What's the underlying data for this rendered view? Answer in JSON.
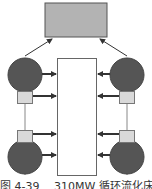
{
  "diagram": {
    "title_caption": "图 4-39 　310MW 循环流化床锅炉",
    "colors": {
      "top_box_fill": "#b3b3b3",
      "top_box_stroke": "#555555",
      "center_box_fill": "#ffffff",
      "center_box_stroke": "#666666",
      "circle_fill": "#555555",
      "circle_stroke": "#444444",
      "small_box_fill": "#d9d9d9",
      "small_box_stroke": "#777777",
      "arrow_color": "#333333",
      "line_color": "#888888"
    },
    "nodes": [
      {
        "id": "top-box",
        "shape": "rect"
      },
      {
        "id": "center-box",
        "shape": "rect"
      },
      {
        "id": "circle-top-left",
        "shape": "circle"
      },
      {
        "id": "circle-top-right",
        "shape": "circle"
      },
      {
        "id": "circle-bottom-left",
        "shape": "circle"
      },
      {
        "id": "circle-bottom-right",
        "shape": "circle"
      },
      {
        "id": "small-box-top-left",
        "shape": "rect"
      },
      {
        "id": "small-box-top-right",
        "shape": "rect"
      },
      {
        "id": "small-box-bottom-left",
        "shape": "rect"
      },
      {
        "id": "small-box-bottom-right",
        "shape": "rect"
      }
    ]
  }
}
